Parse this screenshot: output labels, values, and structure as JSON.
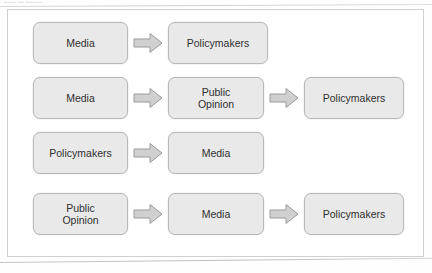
{
  "figure": {
    "scan_artifact_text": "▪▪▪▪▪▪ ▪▪▪ ▪▪▪▪▪▪▪▪",
    "box_fill_color": "#e9e9e9",
    "box_border_color": "#b9b9b9",
    "arrow_fill_color": "#d0d0d0",
    "arrow_border_color": "#9a9a9a",
    "text_color": "#2f2f2f",
    "frame_border_color": "#d0d0d0",
    "rows": [
      {
        "row_label": "media-to-policymakers",
        "nodes": [
          {
            "label": "Media",
            "width_class": "w-narrow"
          },
          {
            "label": "Policymakers",
            "width_class": "w-wide"
          }
        ],
        "arrows": 1
      },
      {
        "row_label": "media-to-public-opinion-to-policymakers",
        "nodes": [
          {
            "label": "Media",
            "width_class": "w-narrow"
          },
          {
            "label": "Public\nOpinion",
            "width_class": "w-mid"
          },
          {
            "label": "Policymakers",
            "width_class": "w-wide"
          }
        ],
        "arrows": 2
      },
      {
        "row_label": "policymakers-to-media",
        "nodes": [
          {
            "label": "Policymakers",
            "width_class": "w-narrow"
          },
          {
            "label": "Media",
            "width_class": "w-mid"
          }
        ],
        "arrows": 1
      },
      {
        "row_label": "public-opinion-to-media-to-policymakers",
        "nodes": [
          {
            "label": "Public\nOpinion",
            "width_class": "w-narrow"
          },
          {
            "label": "Media",
            "width_class": "w-mid"
          },
          {
            "label": "Policymakers",
            "width_class": "w-wide"
          }
        ],
        "arrows": 2
      }
    ]
  }
}
